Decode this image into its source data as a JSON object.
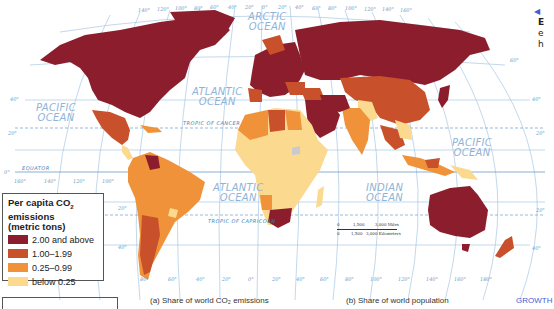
{
  "map": {
    "title": "Per capita CO2 emissions world map",
    "projection": "Robinson-like (curved meridians)",
    "colors": {
      "very_high": "#8b1d2c",
      "high": "#c8502a",
      "medium": "#f0923a",
      "low": "#fbd98f",
      "no_data": "#c9c9cf",
      "ocean": "#ffffff",
      "graticule": "#a8c7e4",
      "tropic_line": "#6a9cc8"
    },
    "oceans": [
      {
        "name": "ARCTIC OCEAN",
        "line1": "ARCTIC",
        "line2": "OCEAN"
      },
      {
        "name": "PACIFIC OCEAN (east)",
        "line1": "PACIFIC",
        "line2": "OCEAN"
      },
      {
        "name": "ATLANTIC OCEAN (north)",
        "line1": "ATLANTIC",
        "line2": "OCEAN"
      },
      {
        "name": "ATLANTIC OCEAN (south)",
        "line1": "ATLANTIC",
        "line2": "OCEAN"
      },
      {
        "name": "INDIAN OCEAN",
        "line1": "INDIAN",
        "line2": "OCEAN"
      },
      {
        "name": "PACIFIC OCEAN (west)",
        "line1": "PACIFIC",
        "line2": "OCEAN"
      }
    ],
    "lines": {
      "equator": "EQUATOR",
      "tropic_cancer": "TROPIC OF CANCER",
      "tropic_capricorn": "TROPIC OF CAPRICORN"
    },
    "top_longitudes": [
      "140°",
      "120°",
      "100°",
      "80°",
      "60°",
      "40°",
      "20°",
      "0°",
      "20°",
      "40°",
      "60°",
      "80°",
      "100°",
      "120°",
      "140°",
      "160°"
    ],
    "bottom_longitudes": [
      "80°",
      "60°",
      "40°",
      "20°",
      "0°",
      "20°",
      "40°",
      "60°",
      "80°",
      "100°",
      "120°",
      "140°",
      "160°",
      "180°"
    ],
    "equator_longitudes": [
      "160°",
      "140°",
      "120°",
      "100°"
    ],
    "latitudes_left": [
      "40°",
      "20°",
      "0°",
      "20°",
      "40°"
    ],
    "latitudes_right": [
      "60°",
      "40°",
      "20°",
      "20°",
      "40°"
    ]
  },
  "legend": {
    "title_line1": "Per capita CO",
    "title_sub": "2",
    "title_line1_end": " emissions",
    "title_line2": "(metric tons)",
    "items": [
      {
        "label": "2.00 and above",
        "color": "#8b1d2c"
      },
      {
        "label": "1.00–1.99",
        "color": "#c8502a"
      },
      {
        "label": "0.25–0.99",
        "color": "#f0923a"
      },
      {
        "label": "below 0.25",
        "color": "#fbd98f"
      }
    ]
  },
  "scale_bar": {
    "miles_zero": "0",
    "miles_mid": "1,500",
    "miles_end": "3,000 Miles",
    "km_zero": "0",
    "km_mid": "1,500",
    "km_end": "3,000 Kilometers"
  },
  "side_text": {
    "arrow": "◀",
    "line1": "E",
    "line2": "e",
    "line3": "h"
  },
  "captions": {
    "a": "(a) Share of world CO₂ emissions",
    "b": "(b) Share of world population",
    "link": "GROWTH"
  }
}
